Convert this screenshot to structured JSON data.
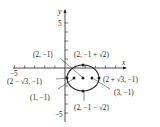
{
  "figure": {
    "type": "ellipse-graph",
    "axes": {
      "x_label": "x",
      "y_label": "y",
      "x_tick_label": "−5",
      "y_tick_top_label": "5",
      "y_tick_bottom_label": "−5"
    },
    "ellipse": {
      "center": [
        2,
        -1
      ],
      "a": "√3",
      "b": "√2"
    },
    "labels": {
      "center": "(2, −1)",
      "top": "(2, −1 + √2)",
      "bottom": "(2, −1 − √2)",
      "right_vertex": "(2 + √3, −1)",
      "left_vertex": "(2 − √3, −1)",
      "focus_left": "(1, −1)",
      "focus_right": "(3, −1)"
    },
    "colors": {
      "ink": "#231f20",
      "background": "#ffffff"
    }
  }
}
